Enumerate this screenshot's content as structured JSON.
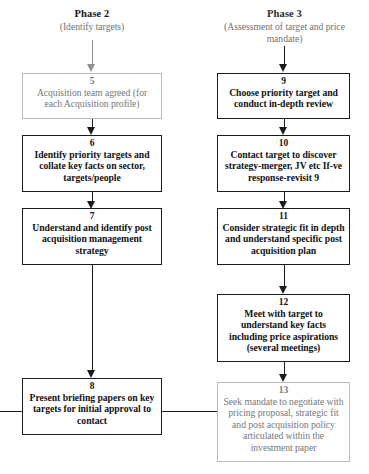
{
  "diagram": {
    "phases": [
      {
        "id": "phase-2",
        "title": "Phase 2",
        "subtitle": "(Identify targets)"
      },
      {
        "id": "phase-3",
        "title": "Phase 3",
        "subtitle": "(Assessment of target and price mandate)"
      }
    ],
    "nodes": [
      {
        "id": "node-5",
        "number": "5",
        "text": "Acquisition team agreed (for each Acquisition profile)",
        "style": "muted",
        "column": "phase-2"
      },
      {
        "id": "node-6",
        "number": "6",
        "text": "Identify priority targets and collate key facts on sector, targets/people",
        "style": "emphasis",
        "column": "phase-2"
      },
      {
        "id": "node-7",
        "number": "7",
        "text": "Understand and identify post acquisition management strategy",
        "style": "emphasis",
        "column": "phase-2"
      },
      {
        "id": "node-8",
        "number": "8",
        "text": "Present briefing papers on key targets for initial approval to contact",
        "style": "emphasis",
        "column": "phase-2"
      },
      {
        "id": "node-9",
        "number": "9",
        "text": "Choose priority target and conduct in-depth review",
        "style": "emphasis",
        "column": "phase-3"
      },
      {
        "id": "node-10",
        "number": "10",
        "text": "Contact target to discover strategy-merger, JV etc If-ve response-revisit 9",
        "style": "emphasis",
        "column": "phase-3"
      },
      {
        "id": "node-11",
        "number": "11",
        "text": "Consider strategic fit in depth and understand specific post acquisition plan",
        "style": "emphasis",
        "column": "phase-3"
      },
      {
        "id": "node-12",
        "number": "12",
        "text": "Meet with target to understand key facts including price aspirations (several meetings)",
        "style": "emphasis",
        "column": "phase-3"
      },
      {
        "id": "node-13",
        "number": "13",
        "text": "Seek mandate to negotiate with pricing proposal, strategic fit and post acquisition policy articulated within the investment paper",
        "style": "muted",
        "column": "phase-3"
      }
    ],
    "colors": {
      "ink": "#1b1c1f",
      "muted": "#75787c",
      "muted_border": "#b9bbbe",
      "background": "#ffffff"
    }
  }
}
